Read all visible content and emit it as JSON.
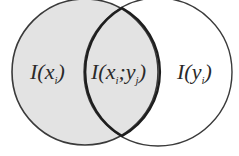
{
  "diagram": {
    "type": "venn",
    "colors": {
      "left_fill": "#e3e3e3",
      "right_fill": "#ffffff",
      "stroke": "#3a3a3a",
      "overlap_stroke": "#1e1e1e"
    },
    "sets": [
      {
        "id": "x",
        "label_main": "I(x",
        "label_sub": "i",
        "label_close": ")"
      },
      {
        "id": "y",
        "label_main": "I(y",
        "label_sub": "i",
        "label_close": ")"
      }
    ],
    "intersection": {
      "label_main": "I(x",
      "label_sub1": "i",
      "label_sep": ";y",
      "label_sub2": "j",
      "label_close": ")"
    }
  }
}
